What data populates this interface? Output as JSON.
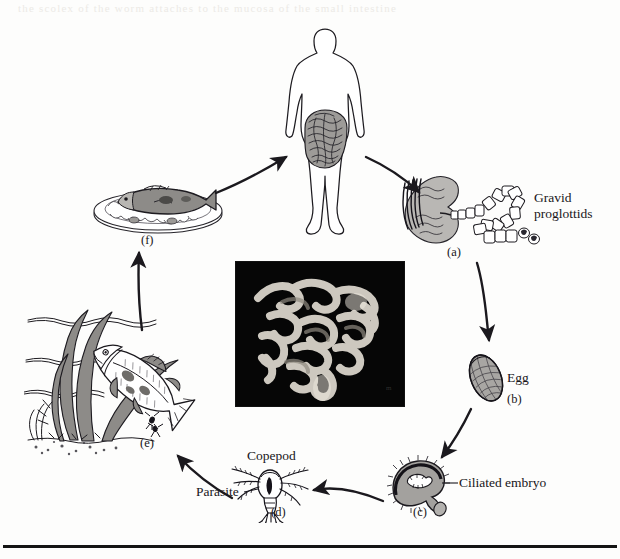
{
  "figure": {
    "bleed_text": "the scolex of the worm  attaches  to the mucosa of the small intestine"
  },
  "labels": {
    "gravid_proglottids": "Gravid\nproglottids",
    "gravid_proglottids_line1": "Gravid",
    "gravid_proglottids_line2": "proglottids",
    "egg": "Egg",
    "ciliated_embryo": "Ciliated embryo",
    "copepod": "Copepod",
    "parasite": "Parasite"
  },
  "stages": [
    {
      "tag": "(a)",
      "name": "adult-worm-in-intestine",
      "caption": "Gravid proglottids"
    },
    {
      "tag": "(b)",
      "name": "egg",
      "caption": "Egg"
    },
    {
      "tag": "(c)",
      "name": "ciliated-embryo-coracidium",
      "caption": "Ciliated embryo"
    },
    {
      "tag": "(d)",
      "name": "copepod-with-parasite",
      "caption": "Copepod"
    },
    {
      "tag": "(e)",
      "name": "fish-eating-copepod",
      "caption": ""
    },
    {
      "tag": "(f)",
      "name": "cooked-fish-on-plate",
      "caption": ""
    }
  ],
  "tags": {
    "a": "(a)",
    "b": "(b)",
    "c": "(c)",
    "d": "(d)",
    "e": "(e)",
    "f": "(f)"
  },
  "colors": {
    "ink": "#18161a",
    "paper": "#fdfdfc",
    "tissue_gray": "#b9b7b4",
    "photo_black": "#050505",
    "rule": "#141414"
  }
}
